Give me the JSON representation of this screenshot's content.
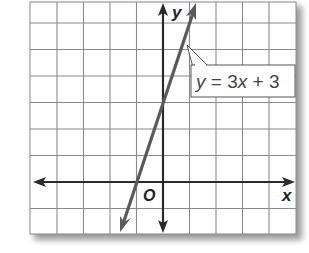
{
  "chart_data": {
    "type": "line",
    "title": "",
    "xlabel": "x",
    "ylabel": "y",
    "origin_label": "O",
    "xlim": [
      -5,
      5
    ],
    "ylim": [
      -2,
      7
    ],
    "grid": true,
    "grid_step": 1,
    "series": [
      {
        "name": "y = 3x + 3",
        "equation": "y = 3x + 3",
        "slope": 3,
        "intercept": 3,
        "x": [
          -1.7,
          -1,
          0,
          1,
          1.3
        ],
        "y": [
          -2.1,
          0,
          3,
          6,
          6.9
        ]
      }
    ],
    "annotations": [
      {
        "text": "y = 3x + 3",
        "points_to": [
          0.9,
          5.7
        ]
      }
    ]
  },
  "labels": {
    "equation_y": "y",
    "equation_eq": " = 3",
    "equation_x": "x",
    "equation_rest": " + 3",
    "x_axis": "x",
    "y_axis": "y",
    "origin": "O"
  },
  "colors": {
    "grid": "#8a8a8a",
    "axis": "#2a2a2a",
    "line": "#5a5a5a",
    "shadow": "#b0b0b0"
  }
}
